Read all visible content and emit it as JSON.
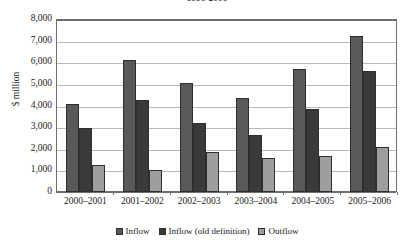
{
  "chart_data": {
    "type": "bar",
    "title": "1996-2006",
    "xlabel": "",
    "ylabel": "$ million",
    "ylim": [
      0,
      8000
    ],
    "ytick_step": 1000,
    "ytick_labels": [
      "0",
      "1,000",
      "2,000",
      "3,000",
      "4,000",
      "5,000",
      "6,000",
      "7,000",
      "8,000"
    ],
    "grid": true,
    "legend_position": "bottom",
    "categories": [
      "2000–2001",
      "2001–2002",
      "2002–2003",
      "2003–2004",
      "2004–2005",
      "2005–2006"
    ],
    "series": [
      {
        "name": "Inflow",
        "color": "#595959",
        "values": [
          4050,
          6120,
          5050,
          4350,
          5700,
          7230
        ]
      },
      {
        "name": "Inflow (old definition)",
        "color": "#3a3a3a",
        "values": [
          2950,
          4270,
          3180,
          2620,
          3820,
          5600
        ]
      },
      {
        "name": "Outflow",
        "color": "#9e9e9e",
        "values": [
          1250,
          1000,
          1870,
          1550,
          1650,
          2100
        ]
      }
    ]
  }
}
